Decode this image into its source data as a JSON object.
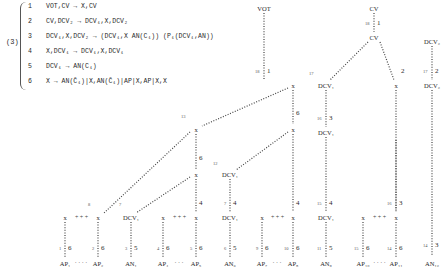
{
  "equation_label": "(3)",
  "rules": [
    {
      "num": "1",
      "text": "VOT,CV → X,CV"
    },
    {
      "num": "2",
      "text": "CV,DCV₂ → DCV₁,X,DCV₂"
    },
    {
      "num": "3",
      "text": "DCV₁,X,DCV₂ → (DCV₁,X AN(C₁)) (P₁(DCV₁,AN))"
    },
    {
      "num": "4",
      "text": "X,DCV₁ → DCV₁,X,DCV₁"
    },
    {
      "num": "5",
      "text": "DCV₁ → AN(C₁)"
    },
    {
      "num": "6",
      "text": "X → AN(C̄₁)|X,AN(C̄₁)|AP|X,AP|X,X"
    }
  ],
  "tree": {
    "nodes": [
      {
        "id": "vot",
        "label": "VOT",
        "x": 264,
        "y": 8
      },
      {
        "id": "cv_top",
        "label": "CV",
        "x": 374,
        "y": 8
      },
      {
        "id": "cv_mid",
        "label": "CV",
        "x": 374,
        "y": 37
      },
      {
        "id": "dcv2_top",
        "label": "DCV₂",
        "x": 432,
        "y": 41
      },
      {
        "id": "x_vot",
        "label": "x",
        "x": 293,
        "y": 85
      },
      {
        "id": "dcv1_a",
        "label": "DCV₁",
        "x": 326,
        "y": 85
      },
      {
        "id": "x_cv",
        "label": "x",
        "x": 396,
        "y": 85
      },
      {
        "id": "dcv2_bot",
        "label": "DCV₂",
        "x": 432,
        "y": 85
      },
      {
        "id": "x_13",
        "label": "x",
        "x": 196,
        "y": 129
      },
      {
        "id": "x_6r",
        "label": "x",
        "x": 293,
        "y": 129
      },
      {
        "id": "dcv1_b",
        "label": "DCV₁",
        "x": 326,
        "y": 132
      },
      {
        "id": "x_6l",
        "label": "x",
        "x": 196,
        "y": 174
      },
      {
        "id": "dcv1_c",
        "label": "DCV₁",
        "x": 230,
        "y": 174
      },
      {
        "id": "x_l1",
        "label": "x",
        "x": 65,
        "y": 217
      },
      {
        "id": "x_l2",
        "label": "x",
        "x": 98,
        "y": 217
      },
      {
        "id": "dcv1_d",
        "label": "DCV₁",
        "x": 131,
        "y": 217
      },
      {
        "id": "x_l3",
        "label": "x",
        "x": 163,
        "y": 217
      },
      {
        "id": "x_l4",
        "label": "x",
        "x": 196,
        "y": 217
      },
      {
        "id": "dcv1_e",
        "label": "DCV₁",
        "x": 230,
        "y": 217
      },
      {
        "id": "x_l5",
        "label": "x",
        "x": 262,
        "y": 217
      },
      {
        "id": "x_l6",
        "label": "x",
        "x": 293,
        "y": 217
      },
      {
        "id": "dcv1_f",
        "label": "DCV₁",
        "x": 326,
        "y": 217
      },
      {
        "id": "x_l7",
        "label": "x",
        "x": 363,
        "y": 217
      },
      {
        "id": "x_l8",
        "label": "x",
        "x": 396,
        "y": 217
      },
      {
        "id": "ap1",
        "label": "AP₁",
        "x": 65,
        "y": 263
      },
      {
        "id": "ap2",
        "label": "AP₂",
        "x": 98,
        "y": 263
      },
      {
        "id": "an1",
        "label": "AN₁",
        "x": 131,
        "y": 263
      },
      {
        "id": "ap4",
        "label": "AP₄",
        "x": 163,
        "y": 263
      },
      {
        "id": "ap5",
        "label": "AP₅",
        "x": 196,
        "y": 263
      },
      {
        "id": "an6",
        "label": "AN₆",
        "x": 230,
        "y": 263
      },
      {
        "id": "ap7",
        "label": "AP₇",
        "x": 262,
        "y": 263
      },
      {
        "id": "ap8",
        "label": "AP₈",
        "x": 293,
        "y": 263
      },
      {
        "id": "an9",
        "label": "AN₉",
        "x": 326,
        "y": 263
      },
      {
        "id": "ap10",
        "label": "AP₁₀",
        "x": 363,
        "y": 263
      },
      {
        "id": "ap11",
        "label": "AP₁₁",
        "x": 396,
        "y": 263
      },
      {
        "id": "an12",
        "label": "AN₁₂",
        "x": 432,
        "y": 263
      }
    ],
    "edges": [
      {
        "from": [
          264,
          13
        ],
        "to": [
          264,
          80
        ],
        "rule": "1",
        "line": "18",
        "lx": 264,
        "ly": 72
      },
      {
        "from": [
          374,
          13
        ],
        "to": [
          374,
          32
        ],
        "rule": "1",
        "line": "18",
        "lx": 374,
        "ly": 24
      },
      {
        "from": [
          368,
          42
        ],
        "to": [
          330,
          80
        ],
        "rule": "",
        "line": "17",
        "lx": 318,
        "ly": 74
      },
      {
        "from": [
          380,
          42
        ],
        "to": [
          394,
          80
        ],
        "rule": "2",
        "line": "",
        "lx": 398,
        "ly": 72
      },
      {
        "from": [
          432,
          46
        ],
        "to": [
          432,
          80
        ],
        "rule": "2",
        "line": "17",
        "lx": 432,
        "ly": 72
      },
      {
        "from": [
          288,
          88
        ],
        "to": [
          202,
          126
        ],
        "rule": "",
        "line": "13",
        "lx": 190,
        "ly": 117
      },
      {
        "from": [
          293,
          90
        ],
        "to": [
          293,
          124
        ],
        "rule": "6",
        "line": "",
        "lx": 293,
        "ly": 114
      },
      {
        "from": [
          326,
          90
        ],
        "to": [
          326,
          127
        ],
        "rule": "3",
        "line": "16",
        "lx": 326,
        "ly": 119
      },
      {
        "from": [
          396,
          90
        ],
        "to": [
          396,
          210
        ],
        "rule": "",
        "line": "",
        "lx": 0,
        "ly": 0
      },
      {
        "from": [
          432,
          90
        ],
        "to": [
          432,
          256
        ],
        "rule": "3",
        "line": "14",
        "lx": 432,
        "ly": 246
      },
      {
        "from": [
          196,
          134
        ],
        "to": [
          196,
          169
        ],
        "rule": "6",
        "line": "",
        "lx": 196,
        "ly": 159
      },
      {
        "from": [
          190,
          132
        ],
        "to": [
          104,
          213
        ],
        "rule": "",
        "line": "8",
        "lx": 94,
        "ly": 205
      },
      {
        "from": [
          288,
          132
        ],
        "to": [
          236,
          170
        ],
        "rule": "",
        "line": "12",
        "lx": 222,
        "ly": 164
      },
      {
        "from": [
          293,
          134
        ],
        "to": [
          293,
          212
        ],
        "rule": "4",
        "line": "",
        "lx": 293,
        "ly": 204
      },
      {
        "from": [
          326,
          137
        ],
        "to": [
          326,
          212
        ],
        "rule": "4",
        "line": "15",
        "lx": 326,
        "ly": 204
      },
      {
        "from": [
          190,
          177
        ],
        "to": [
          136,
          213
        ],
        "rule": "",
        "line": "7",
        "lx": 125,
        "ly": 205
      },
      {
        "from": [
          196,
          179
        ],
        "to": [
          196,
          212
        ],
        "rule": "4",
        "line": "",
        "lx": 196,
        "ly": 204
      },
      {
        "from": [
          230,
          179
        ],
        "to": [
          230,
          212
        ],
        "rule": "4",
        "line": "7",
        "lx": 230,
        "ly": 204
      },
      {
        "from": [
          396,
          140
        ],
        "to": [
          396,
          212
        ],
        "rule": "3",
        "line": "16",
        "lx": 396,
        "ly": 204
      },
      {
        "from": [
          65,
          222
        ],
        "to": [
          65,
          258
        ],
        "rule": "6",
        "line": "1",
        "lx": 65,
        "ly": 249
      },
      {
        "from": [
          98,
          222
        ],
        "to": [
          98,
          258
        ],
        "rule": "6",
        "line": "2",
        "lx": 98,
        "ly": 249
      },
      {
        "from": [
          131,
          222
        ],
        "to": [
          131,
          258
        ],
        "rule": "5",
        "line": "3",
        "lx": 131,
        "ly": 249
      },
      {
        "from": [
          163,
          222
        ],
        "to": [
          163,
          258
        ],
        "rule": "6",
        "line": "4",
        "lx": 163,
        "ly": 249
      },
      {
        "from": [
          196,
          222
        ],
        "to": [
          196,
          258
        ],
        "rule": "6",
        "line": "5",
        "lx": 196,
        "ly": 249
      },
      {
        "from": [
          230,
          222
        ],
        "to": [
          230,
          258
        ],
        "rule": "5",
        "line": "6",
        "lx": 230,
        "ly": 249
      },
      {
        "from": [
          262,
          222
        ],
        "to": [
          262,
          258
        ],
        "rule": "6",
        "line": "9",
        "lx": 262,
        "ly": 249
      },
      {
        "from": [
          293,
          222
        ],
        "to": [
          293,
          258
        ],
        "rule": "6",
        "line": "10",
        "lx": 293,
        "ly": 249
      },
      {
        "from": [
          326,
          222
        ],
        "to": [
          326,
          258
        ],
        "rule": "5",
        "line": "11",
        "lx": 326,
        "ly": 249
      },
      {
        "from": [
          363,
          222
        ],
        "to": [
          363,
          258
        ],
        "rule": "6",
        "line": "15",
        "lx": 363,
        "ly": 249
      },
      {
        "from": [
          396,
          222
        ],
        "to": [
          396,
          258
        ],
        "rule": "6",
        "line": "14",
        "lx": 396,
        "ly": 249
      }
    ],
    "sibling_links": [
      {
        "from": [
          70,
          217
        ],
        "to": [
          93,
          217
        ],
        "style": "+ + +"
      },
      {
        "from": [
          168,
          217
        ],
        "to": [
          191,
          217
        ],
        "style": "+ + +"
      },
      {
        "from": [
          267,
          217
        ],
        "to": [
          288,
          217
        ],
        "style": "+ + +"
      },
      {
        "from": [
          368,
          217
        ],
        "to": [
          391,
          217
        ],
        "style": "+ + +"
      },
      {
        "from": [
          72,
          263
        ],
        "to": [
          90,
          263
        ],
        "style": "· · · ·"
      },
      {
        "from": [
          170,
          263
        ],
        "to": [
          188,
          263
        ],
        "style": "· · ·"
      },
      {
        "from": [
          269,
          263
        ],
        "to": [
          285,
          263
        ],
        "style": "· · ·"
      },
      {
        "from": [
          372,
          263
        ],
        "to": [
          387,
          263
        ],
        "style": "· · · ·"
      }
    ]
  }
}
